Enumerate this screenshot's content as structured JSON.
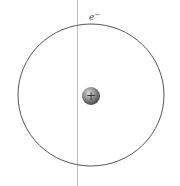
{
  "diagram": {
    "type": "atom-orbit",
    "electron_label": "e",
    "electron_charge": "−",
    "nucleus_label": "+",
    "colors": {
      "orbit": "#555555",
      "axis_line": "#bbbbbb",
      "nucleus_dark": "#5a5a5a",
      "nucleus_light": "#d0d0d0",
      "text": "#444444"
    }
  }
}
